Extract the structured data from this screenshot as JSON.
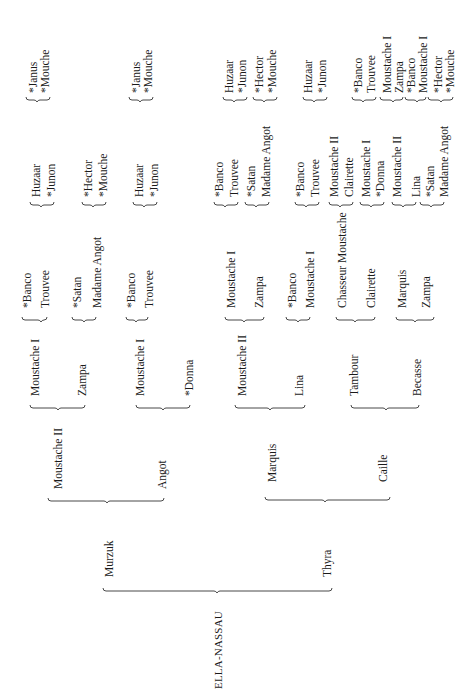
{
  "root": "ELLA-NASSAU",
  "pedigree": {
    "name": "ELLA-NASSAU",
    "sire": {
      "name": "Murzuk",
      "sire": {
        "name": "Moustache II",
        "sire": {
          "name": "Moustache I",
          "sire": {
            "name": "*Banco",
            "sire": {
              "name": "Huzaar"
            },
            "dam": {
              "name": "*Junon"
            }
          },
          "dam": {
            "name": "Trouvee",
            "sire": {
              "name": "*Hector"
            },
            "dam": {
              "name": "*Mouche"
            }
          }
        },
        "dam": {
          "name": "Zampa",
          "sire": {
            "name": "*Satan",
            "sire": {
              "name": "Huzaar"
            },
            "dam": {
              "name": "*Junon"
            }
          },
          "dam": {
            "name": "Madame Angot",
            "sire": {
              "name": "*Janus"
            },
            "dam": {
              "name": "*Mouche"
            }
          }
        }
      },
      "dam": {
        "name": "Angot",
        "sire": {
          "name": "Moustache I",
          "sire": {
            "name": "*Banco",
            "sire": {
              "name": "Huzaar"
            },
            "dam": {
              "name": "*Junon"
            }
          },
          "dam": {
            "name": "Trouvee",
            "sire": {
              "name": "*Janus"
            },
            "dam": {
              "name": "*Mouche"
            }
          }
        },
        "dam": {
          "name": "*Donna"
        }
      }
    },
    "dam": {
      "name": "Thyra",
      "sire": {
        "name": "Marquis",
        "sire": {
          "name": "Moustache II",
          "sire": {
            "name": "Moustache I",
            "sire": {
              "name": "*Banco"
            },
            "dam": {
              "name": "Trouvee"
            }
          },
          "dam": {
            "name": "Zampa",
            "sire": {
              "name": "*Satan"
            },
            "dam": {
              "name": "Madame Angot"
            }
          }
        },
        "dam": {
          "name": "Lina",
          "sire": {
            "name": "*Banco",
            "sire": {
              "name": "Huzaar"
            },
            "dam": {
              "name": "*Junon"
            }
          },
          "dam": {
            "name": "Moustache I",
            "sire": {
              "name": "*Hector"
            },
            "dam": {
              "name": "*Mouche"
            }
          }
        }
      },
      "dam": {
        "name": "Caille",
        "sire": {
          "name": "Tambour",
          "sire": {
            "name": "Chasseur Moustache",
            "sire": {
              "name": "*Banco"
            },
            "dam": {
              "name": "Trouvee"
            }
          },
          "dam": {
            "name": "Clairette",
            "sire": {
              "name": "Moustache I"
            },
            "dam": {
              "name": "Zampa"
            }
          }
        },
        "dam": {
          "name": "Becasse",
          "sire": {
            "name": "Marquis",
            "sire": {
              "name": "*Banco"
            },
            "dam": {
              "name": "Moustache I"
            }
          },
          "dam": {
            "name": "Zampa",
            "sire": {
              "name": "*Hector"
            },
            "dam": {
              "name": "*Mouche"
            }
          }
        }
      }
    }
  },
  "labels": {
    "g0": [
      "ELLA-NASSAU"
    ],
    "g1": [
      "Murzuk",
      "Thyra"
    ],
    "g2": [
      "Moustache II",
      "Angot",
      "Marquis",
      "Caille"
    ],
    "g3": [
      "Moustache I",
      "Zampa",
      "Moustache I",
      "*Donna",
      "Moustache II",
      "Lina",
      "Tambour",
      "Becasse"
    ],
    "g4": [
      "*Banco",
      "Trouvee",
      "*Satan",
      "Madame Angot",
      "*Banco",
      "Trouvee",
      "Moustache I",
      "Zampa",
      "*Banco",
      "Moustache I",
      "Chasseur Moustache",
      "Clairette",
      "Marquis",
      "Zampa"
    ],
    "g5": [
      "Huzaar",
      "*Junon",
      "*Hector",
      "*Mouche",
      "Huzaar",
      "*Junon",
      "*Banco",
      "Trouvee",
      "*Satan",
      "Madame Angot",
      "*Banco",
      "Trouvee",
      "Moustache II",
      "Clairette",
      "Moustache I",
      "*Donna",
      "Moustache II",
      "Lina",
      "*Satan",
      "Madame Angot"
    ],
    "g6": [
      "*Janus",
      "*Mouche",
      "*Janus",
      "*Mouche",
      "Huzaar",
      "*Junon",
      "*Hector",
      "*Mouche",
      "Huzaar",
      "*Junon",
      "*Banco",
      "Trouvee",
      "Moustache I",
      "Zampa",
      "*Banco",
      "Moustache I",
      "*Hector",
      "*Mouche"
    ]
  }
}
